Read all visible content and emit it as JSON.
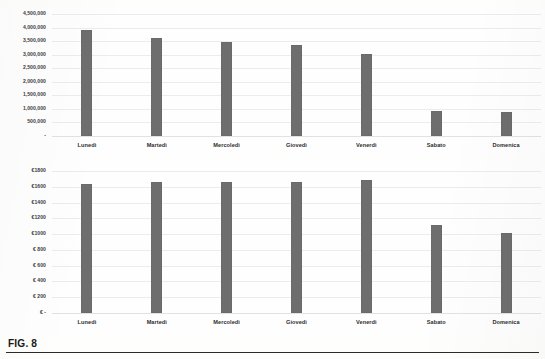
{
  "figure": {
    "caption": "FIG. 8"
  },
  "colors": {
    "bar": "#6e6e6e",
    "gridline": "#ececec",
    "text": "#2e2e2e",
    "rule": "#2b2b2b",
    "background": "#fefefd"
  },
  "chart_data": [
    {
      "id": "top",
      "type": "bar",
      "title": "",
      "xlabel": "",
      "ylabel": "",
      "categories": [
        "Lunedì",
        "Martedì",
        "Mercoledì",
        "Giovedì",
        "Venerdì",
        "Sabato",
        "Domenica"
      ],
      "values": [
        3900000,
        3620000,
        3480000,
        3340000,
        3030000,
        940000,
        870000
      ],
      "ylim": [
        0,
        4500000
      ],
      "ytick_values": [
        4500000,
        4000000,
        3500000,
        3000000,
        2500000,
        2000000,
        1500000,
        1000000,
        500000,
        0
      ],
      "ytick_labels": [
        "4,500,000",
        "4,000,000",
        "3,500,000",
        "3,000,000",
        "2,500,000",
        "2,000,000",
        "1,500,000",
        "1,000,000",
        "500,000",
        "-"
      ],
      "grid": true,
      "legend": "none"
    },
    {
      "id": "bottom",
      "type": "bar",
      "title": "",
      "xlabel": "",
      "ylabel": "",
      "categories": [
        "Lunedì",
        "Martedì",
        "Mercoledì",
        "Giovedì",
        "Venerdì",
        "Sabato",
        "Domenica"
      ],
      "values": [
        1640,
        1660,
        1665,
        1665,
        1680,
        1110,
        1010
      ],
      "ylim": [
        0,
        1800
      ],
      "ytick_values": [
        1800,
        1600,
        1400,
        1200,
        1000,
        800,
        600,
        400,
        200,
        0
      ],
      "ytick_labels": [
        "€1800",
        "€1600",
        "€1400",
        "€1200",
        "€1000",
        "€ 800",
        "€ 600",
        "€ 400",
        "€ 200",
        "€ -"
      ],
      "grid": true,
      "legend": "none"
    }
  ]
}
